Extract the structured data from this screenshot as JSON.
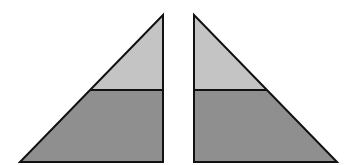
{
  "diagram": {
    "colors": {
      "light_fill": "#c4c4c4",
      "dark_fill": "#8f8f8f",
      "stroke": "#111111",
      "background": "#ffffff"
    },
    "shapes": [
      {
        "name": "left-triangle",
        "apex": [
          163,
          15
        ],
        "base_left": [
          20,
          162
        ],
        "base_right": [
          163,
          162
        ],
        "divider_y": 90
      },
      {
        "name": "right-triangle",
        "apex": [
          194,
          15
        ],
        "base_left": [
          194,
          162
        ],
        "base_right": [
          337,
          162
        ],
        "divider_y": 90
      }
    ]
  }
}
